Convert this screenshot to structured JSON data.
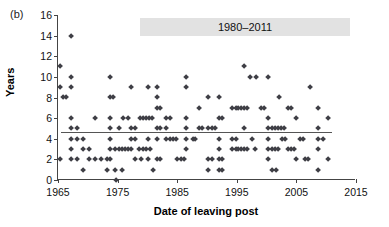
{
  "figure": {
    "panel_label": "(b)"
  },
  "chart_data": {
    "type": "scatter",
    "title": "",
    "xlabel": "Date of leaving post",
    "ylabel": "Years",
    "xlim": [
      1965,
      2015
    ],
    "ylim": [
      0,
      16
    ],
    "xticks": [
      1965,
      1975,
      1985,
      1995,
      2005,
      2015
    ],
    "yticks": [
      0,
      2,
      4,
      6,
      8,
      10,
      12,
      14,
      16
    ],
    "grid": false,
    "legend_position": "top-center",
    "legend_label": "1980–2011",
    "marker": "diamond",
    "marker_color": "#3f3f46",
    "annotations": [
      {
        "type": "hline",
        "label": "mean",
        "y": 4.7,
        "x_start": 1965.5,
        "x_end": 2011,
        "color": "#555555"
      }
    ],
    "points": [
      [
        1965.3,
        11
      ],
      [
        1965.3,
        9
      ],
      [
        1965.8,
        8
      ],
      [
        1966.3,
        8
      ],
      [
        1965.3,
        2
      ],
      [
        1967.2,
        14
      ],
      [
        1967.2,
        10
      ],
      [
        1967.2,
        9
      ],
      [
        1967.2,
        6
      ],
      [
        1967.2,
        5
      ],
      [
        1967.2,
        4
      ],
      [
        1967.2,
        3
      ],
      [
        1967.2,
        2
      ],
      [
        1968.2,
        5
      ],
      [
        1968.2,
        4
      ],
      [
        1968.2,
        2
      ],
      [
        1969.2,
        4
      ],
      [
        1969.2,
        3
      ],
      [
        1969.2,
        1
      ],
      [
        1970.2,
        3
      ],
      [
        1970.2,
        2
      ],
      [
        1971.2,
        2
      ],
      [
        1972.2,
        2
      ],
      [
        1973.2,
        2
      ],
      [
        1971.3,
        6
      ],
      [
        1973.8,
        10
      ],
      [
        1973.8,
        8
      ],
      [
        1974.3,
        8
      ],
      [
        1973.8,
        6
      ],
      [
        1973.8,
        5
      ],
      [
        1973.8,
        4
      ],
      [
        1973.8,
        3
      ],
      [
        1973.8,
        2
      ],
      [
        1974.6,
        3
      ],
      [
        1974.6,
        1
      ],
      [
        1974.8,
        0
      ],
      [
        1973.2,
        1
      ],
      [
        1975.3,
        3
      ],
      [
        1975.3,
        5
      ],
      [
        1975.8,
        3
      ],
      [
        1976.3,
        3
      ],
      [
        1976.8,
        3
      ],
      [
        1976.0,
        6
      ],
      [
        1976.8,
        6
      ],
      [
        1975.8,
        1
      ],
      [
        1977.3,
        9
      ],
      [
        1977.3,
        5
      ],
      [
        1977.3,
        4
      ],
      [
        1977.3,
        3
      ],
      [
        1978.0,
        5
      ],
      [
        1978.0,
        4
      ],
      [
        1978.0,
        2
      ],
      [
        1978.8,
        6
      ],
      [
        1979.3,
        6
      ],
      [
        1979.8,
        6
      ],
      [
        1980.3,
        6
      ],
      [
        1980.8,
        6
      ],
      [
        1978.6,
        3
      ],
      [
        1979.2,
        3
      ],
      [
        1979.8,
        3
      ],
      [
        1980.4,
        3
      ],
      [
        1979.0,
        2
      ],
      [
        1980.2,
        9
      ],
      [
        1980.2,
        4
      ],
      [
        1980.2,
        2
      ],
      [
        1981.6,
        9
      ],
      [
        1981.6,
        8
      ],
      [
        1981.6,
        7
      ],
      [
        1982.1,
        7
      ],
      [
        1981.6,
        5
      ],
      [
        1982.1,
        5
      ],
      [
        1981.6,
        4
      ],
      [
        1981.6,
        2
      ],
      [
        1982.1,
        2
      ],
      [
        1981.0,
        1
      ],
      [
        1983.2,
        5
      ],
      [
        1983.2,
        4
      ],
      [
        1983.8,
        4
      ],
      [
        1984.3,
        4
      ],
      [
        1984.8,
        4
      ],
      [
        1983.2,
        6
      ],
      [
        1983.8,
        6
      ],
      [
        1985.0,
        2
      ],
      [
        1985.6,
        2
      ],
      [
        1986.1,
        2
      ],
      [
        1986.5,
        10
      ],
      [
        1986.5,
        9
      ],
      [
        1986.5,
        6
      ],
      [
        1986.5,
        5
      ],
      [
        1986.5,
        4
      ],
      [
        1986.5,
        3
      ],
      [
        1987.6,
        4
      ],
      [
        1988.6,
        7
      ],
      [
        1988.6,
        5
      ],
      [
        1989.2,
        5
      ],
      [
        1988.0,
        4
      ],
      [
        1990.2,
        8
      ],
      [
        1990.2,
        5
      ],
      [
        1990.8,
        5
      ],
      [
        1991.3,
        5
      ],
      [
        1990.2,
        2
      ],
      [
        1990.8,
        2
      ],
      [
        1990.2,
        1
      ],
      [
        1992.0,
        8
      ],
      [
        1992.0,
        6
      ],
      [
        1992.5,
        6
      ],
      [
        1992.0,
        4
      ],
      [
        1992.0,
        3
      ],
      [
        1992.0,
        2
      ],
      [
        1992.6,
        2
      ],
      [
        1992.0,
        1
      ],
      [
        1992.6,
        1
      ],
      [
        1994.2,
        7
      ],
      [
        1994.8,
        7
      ],
      [
        1995.3,
        7
      ],
      [
        1995.8,
        7
      ],
      [
        1996.3,
        7
      ],
      [
        1996.8,
        7
      ],
      [
        1994.2,
        3
      ],
      [
        1994.8,
        3
      ],
      [
        1995.3,
        3
      ],
      [
        1995.8,
        3
      ],
      [
        1996.3,
        3
      ],
      [
        1996.8,
        3
      ],
      [
        1994.2,
        4
      ],
      [
        1994.8,
        4
      ],
      [
        1996.2,
        11
      ],
      [
        1996.2,
        5
      ],
      [
        1997.3,
        10
      ],
      [
        1998.3,
        10
      ],
      [
        1997.5,
        4
      ],
      [
        1998.0,
        3
      ],
      [
        1999.0,
        7
      ],
      [
        1999.6,
        7
      ],
      [
        2000.3,
        10
      ],
      [
        2000.3,
        6
      ],
      [
        2000.3,
        4
      ],
      [
        2000.3,
        3
      ],
      [
        2000.3,
        5
      ],
      [
        2000.9,
        5
      ],
      [
        2001.4,
        5
      ],
      [
        2001.9,
        5
      ],
      [
        2002.4,
        5
      ],
      [
        2002.9,
        5
      ],
      [
        2000.9,
        3
      ],
      [
        2001.4,
        3
      ],
      [
        2001.9,
        3
      ],
      [
        2000.3,
        2
      ],
      [
        2001.0,
        1
      ],
      [
        2001.6,
        1
      ],
      [
        2002.1,
        8
      ],
      [
        2002.6,
        4
      ],
      [
        2003.1,
        4
      ],
      [
        2003.6,
        7
      ],
      [
        2004.1,
        7
      ],
      [
        2003.6,
        3
      ],
      [
        2004.1,
        3
      ],
      [
        2004.6,
        3
      ],
      [
        2005.0,
        6
      ],
      [
        2005.0,
        2
      ],
      [
        2005.6,
        4
      ],
      [
        2006.1,
        4
      ],
      [
        2006.4,
        2
      ],
      [
        2006.9,
        2
      ],
      [
        2007.3,
        9
      ],
      [
        2008.6,
        7
      ],
      [
        2008.6,
        5
      ],
      [
        2008.6,
        4
      ],
      [
        2008.6,
        3
      ],
      [
        2008.6,
        1
      ],
      [
        2009.5,
        4
      ],
      [
        2010.3,
        6
      ],
      [
        2010.3,
        2
      ]
    ]
  }
}
